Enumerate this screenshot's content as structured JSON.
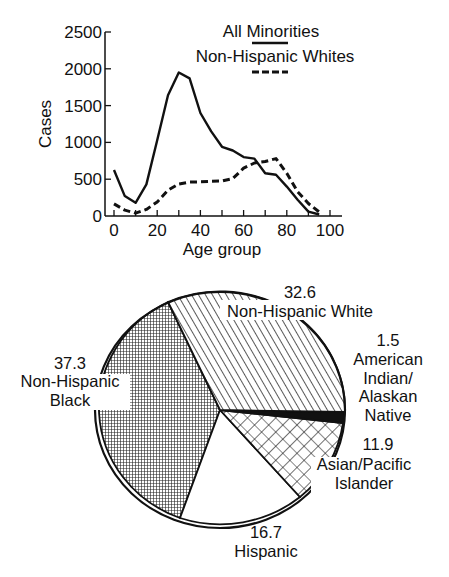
{
  "chart_data": [
    {
      "type": "line",
      "title": "",
      "xlabel": "Age group",
      "ylabel": "Cases",
      "xlim": [
        0,
        100
      ],
      "ylim": [
        0,
        2500
      ],
      "x_ticks": [
        0,
        20,
        40,
        60,
        80,
        100
      ],
      "y_ticks": [
        0,
        500,
        1000,
        1500,
        2000,
        2500
      ],
      "grid": false,
      "legend_position": "top-right",
      "x": [
        0,
        5,
        10,
        15,
        20,
        25,
        30,
        35,
        40,
        45,
        50,
        55,
        60,
        65,
        70,
        75,
        80,
        85,
        90,
        95
      ],
      "series": [
        {
          "name": "All Minorities",
          "style": "solid",
          "values": [
            625,
            270,
            180,
            430,
            1030,
            1640,
            1950,
            1870,
            1400,
            1150,
            940,
            890,
            800,
            780,
            580,
            560,
            400,
            220,
            60,
            20
          ]
        },
        {
          "name": "Non-Hispanic Whites",
          "style": "dashed",
          "values": [
            165,
            80,
            40,
            90,
            190,
            350,
            435,
            460,
            465,
            470,
            475,
            510,
            650,
            720,
            740,
            780,
            580,
            330,
            170,
            55
          ]
        }
      ]
    },
    {
      "type": "pie",
      "title": "",
      "unit": "percent",
      "slices": [
        {
          "label": "Non-Hispanic White",
          "value": 32.6,
          "pattern": "diagonal-hatch"
        },
        {
          "label": "American Indian/ Alaskan Native",
          "value": 1.5,
          "pattern": "solid-black"
        },
        {
          "label": "Asian/Pacific Islander",
          "value": 11.9,
          "pattern": "crosshatch"
        },
        {
          "label": "Hispanic",
          "value": 16.7,
          "pattern": "white"
        },
        {
          "label": "Non-Hispanic Black",
          "value": 37.3,
          "pattern": "fine-grid"
        }
      ]
    }
  ],
  "line_chart": {
    "ylabel": "Cases",
    "xlabel": "Age group",
    "y_ticks": [
      "2500",
      "2000",
      "1500",
      "1000",
      "500",
      "0"
    ],
    "x_ticks": [
      "0",
      "20",
      "40",
      "60",
      "80",
      "100"
    ],
    "legend": {
      "series1": "All Minorities",
      "series2": "Non-Hispanic Whites"
    }
  },
  "pie_chart": {
    "white": {
      "value": "32.6",
      "line1": "Non-Hispanic White"
    },
    "amind": {
      "value": "1.5",
      "line1": "American",
      "line2": "Indian/",
      "line3": "Alaskan",
      "line4": "Native"
    },
    "asian": {
      "value": "11.9",
      "line1": "Asian/Pacific",
      "line2": "Islander"
    },
    "hispanic": {
      "value": "16.7",
      "line1": "Hispanic"
    },
    "black": {
      "value": "37.3",
      "line1": "Non-Hispanic",
      "line2": "Black"
    }
  },
  "colors": {
    "ink": "#111111",
    "background": "#ffffff"
  }
}
